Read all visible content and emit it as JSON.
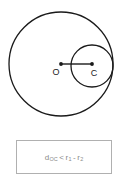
{
  "figure": {
    "background_color": "#ffffff",
    "stroke_color": "#1a1a1a"
  },
  "diagram": {
    "outer_circle": {
      "name": "outer-circle",
      "center_label": "O",
      "cx": 61,
      "cy": 64,
      "r": 52,
      "radius_symbol": "r",
      "radius_index": "1"
    },
    "inner_circle": {
      "name": "inner-circle",
      "center_label": "C",
      "cx": 92,
      "cy": 66,
      "r": 21,
      "radius_symbol": "r",
      "radius_index": "2"
    },
    "center_segment": {
      "name": "center-distance-segment",
      "x1": 61,
      "y1": 64,
      "x2": 92,
      "y2": 64,
      "distance_symbol": "d"
    },
    "labels": {
      "outer_center": "O",
      "inner_center": "C"
    }
  },
  "caption": {
    "border_color": "#b0b0b0",
    "text_color": "#8a8a8a",
    "formula": {
      "full_text": "d_OC < r_1 - r_2",
      "distance_symbol": "d",
      "distance_subscript": "OC",
      "relation": "<",
      "left_radius_symbol": "r",
      "left_radius_subscript": "1",
      "minus": "-",
      "right_radius_symbol": "r",
      "right_radius_subscript": "2"
    }
  }
}
